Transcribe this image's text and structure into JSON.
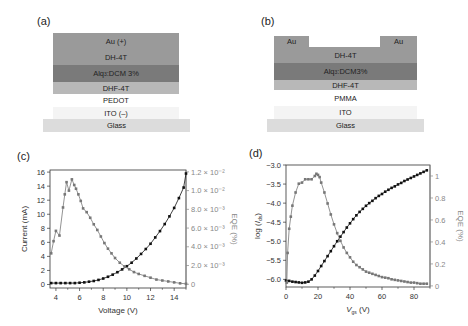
{
  "panels": {
    "a": {
      "label": "(a)",
      "layers": [
        {
          "name": "Au (+)",
          "color": "#9a9a9a"
        },
        {
          "name": "DH-4T",
          "color": "#9a9a9a"
        },
        {
          "name": "Alq3:DCM 3%",
          "color": "#7a7a7a"
        },
        {
          "name": "DHF-4T",
          "color": "#b8b8b8"
        },
        {
          "name": "PEDOT",
          "color": "#ffffff"
        },
        {
          "name": "ITO (–)",
          "color": "#f4f4f4"
        },
        {
          "name": "Glass",
          "color": "#dcdcdc"
        }
      ]
    },
    "b": {
      "label": "(b)",
      "layers": [
        {
          "name": "Au",
          "color": "#9a9a9a"
        },
        {
          "name": "Au",
          "color": "#9a9a9a"
        },
        {
          "name": "DH-4T",
          "color": "#9a9a9a"
        },
        {
          "name": "Alq3:DCM3%",
          "color": "#7a7a7a"
        },
        {
          "name": "DHF-4T",
          "color": "#b8b8b8"
        },
        {
          "name": "PMMA",
          "color": "#ffffff"
        },
        {
          "name": "ITO",
          "color": "#f4f4f4"
        },
        {
          "name": "Glass",
          "color": "#dcdcdc"
        }
      ]
    }
  },
  "chart_data": [
    {
      "panel": "(c)",
      "type": "line",
      "title": "",
      "xlabel": "Voltage (V)",
      "ylabel": "Current (mA)",
      "y2label": "EQE (%)",
      "xlim": [
        3.5,
        15
      ],
      "ylim": [
        -0.5,
        16.3
      ],
      "y2lim": [
        -0.0004,
        0.0122
      ],
      "xticks": [
        4,
        6,
        8,
        10,
        12,
        14
      ],
      "yticks": [
        0,
        2,
        4,
        6,
        8,
        10,
        12,
        14,
        16
      ],
      "y2ticks": [
        "0",
        "2.0 × 10⁻³",
        "4.0 × 10⁻³",
        "6.0 × 10⁻³",
        "8.0 × 10⁻³",
        "1.0 × 10⁻²",
        "1.2 × 10⁻²"
      ],
      "grid": false,
      "series": [
        {
          "name": "Current",
          "axis": "left",
          "color": "#111111",
          "x": [
            3.6,
            4.0,
            4.4,
            4.8,
            5.2,
            5.6,
            6.0,
            6.4,
            6.8,
            7.2,
            7.6,
            8.0,
            8.4,
            8.8,
            9.2,
            9.6,
            10.0,
            10.4,
            10.8,
            11.2,
            11.6,
            12.0,
            12.4,
            12.8,
            13.2,
            13.6,
            14.0,
            14.4,
            14.8,
            15.0
          ],
          "values": [
            0.2,
            0.2,
            0.2,
            0.2,
            0.2,
            0.2,
            0.25,
            0.3,
            0.4,
            0.5,
            0.65,
            0.85,
            1.1,
            1.4,
            1.75,
            2.15,
            2.6,
            3.1,
            3.7,
            4.35,
            5.05,
            5.8,
            6.7,
            7.6,
            8.6,
            9.7,
            10.9,
            12.3,
            13.8,
            15.8
          ]
        },
        {
          "name": "EQE",
          "axis": "right",
          "color": "#777777",
          "x": [
            3.6,
            3.8,
            4.0,
            4.3,
            4.6,
            4.75,
            4.9,
            5.1,
            5.35,
            5.55,
            5.7,
            5.9,
            6.1,
            6.3,
            6.6,
            6.9,
            7.2,
            7.5,
            7.8,
            8.1,
            8.4,
            8.7,
            9.0,
            9.4,
            9.8,
            10.2,
            10.6,
            11.0,
            11.5,
            12.0,
            12.5,
            13.0,
            13.5,
            14.0,
            14.5,
            15.0
          ],
          "values": [
            0.0033,
            0.0046,
            0.0057,
            0.0052,
            0.0082,
            0.0096,
            0.0109,
            0.01,
            0.0112,
            0.0106,
            0.0102,
            0.0096,
            0.0089,
            0.0081,
            0.0077,
            0.0071,
            0.0064,
            0.0058,
            0.0051,
            0.0044,
            0.0038,
            0.0033,
            0.0028,
            0.0023,
            0.0019,
            0.0016,
            0.0013,
            0.0011,
            0.0009,
            0.0007,
            0.0005,
            0.0004,
            0.0003,
            0.0002,
            0.0001,
            5e-05
          ]
        }
      ]
    },
    {
      "panel": "(d)",
      "type": "line",
      "title": "",
      "xlabel": "V_gs (V)",
      "ylabel": "log (I_ds)",
      "y2label": "EQE (%)",
      "xlim": [
        0,
        90
      ],
      "ylim": [
        -6.2,
        -3.0
      ],
      "y2lim": [
        -0.01,
        1.1
      ],
      "xticks": [
        0,
        20,
        40,
        60,
        80
      ],
      "yticks": [
        -6.0,
        -5.5,
        -5.0,
        -4.5,
        -4.0,
        -3.5,
        -3.0
      ],
      "y2ticks": [
        0,
        0.2,
        0.4,
        0.6,
        0.8,
        1.0
      ],
      "grid": false,
      "series": [
        {
          "name": "log(Ids)",
          "axis": "left",
          "color": "#111111",
          "x": [
            0,
            2,
            4,
            6,
            8,
            10,
            12,
            14,
            16,
            18,
            20,
            22,
            24,
            26,
            28,
            30,
            32,
            34,
            36,
            38,
            40,
            42,
            44,
            46,
            48,
            50,
            52,
            54,
            56,
            58,
            60,
            62,
            64,
            66,
            68,
            70,
            72,
            74,
            76,
            78,
            80,
            82,
            84,
            86,
            88
          ],
          "values": [
            -6.03,
            -6.04,
            -6.06,
            -6.07,
            -6.08,
            -6.09,
            -6.08,
            -6.06,
            -6.0,
            -5.9,
            -5.78,
            -5.65,
            -5.52,
            -5.39,
            -5.26,
            -5.13,
            -5.0,
            -4.88,
            -4.76,
            -4.64,
            -4.53,
            -4.42,
            -4.32,
            -4.23,
            -4.15,
            -4.07,
            -4.0,
            -3.94,
            -3.87,
            -3.81,
            -3.76,
            -3.7,
            -3.65,
            -3.6,
            -3.56,
            -3.51,
            -3.47,
            -3.42,
            -3.38,
            -3.34,
            -3.3,
            -3.26,
            -3.22,
            -3.18,
            -3.14
          ]
        },
        {
          "name": "EQE",
          "axis": "right",
          "color": "#777777",
          "x": [
            0.5,
            1,
            2,
            3,
            4,
            6,
            8,
            10,
            12,
            14,
            16,
            18,
            19,
            20,
            21,
            22,
            24,
            26,
            28,
            30,
            32,
            34,
            36,
            38,
            40,
            42,
            44,
            46,
            48,
            50,
            52,
            54,
            56,
            58,
            60,
            62,
            64,
            66,
            68,
            70,
            72,
            74,
            76,
            78,
            80,
            82,
            84,
            86,
            88
          ],
          "values": [
            0.03,
            0.3,
            0.52,
            0.63,
            0.73,
            0.85,
            0.93,
            0.94,
            0.97,
            0.97,
            0.97,
            1.0,
            1.02,
            1.01,
            0.99,
            0.94,
            0.85,
            0.75,
            0.65,
            0.56,
            0.48,
            0.41,
            0.35,
            0.3,
            0.26,
            0.22,
            0.19,
            0.17,
            0.15,
            0.13,
            0.12,
            0.11,
            0.1,
            0.09,
            0.08,
            0.075,
            0.07,
            0.06,
            0.055,
            0.05,
            0.045,
            0.04,
            0.035,
            0.03,
            0.03,
            0.025,
            0.02,
            0.02,
            0.02
          ]
        }
      ]
    }
  ]
}
